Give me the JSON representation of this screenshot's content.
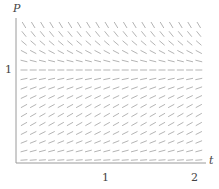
{
  "chart_data": {
    "type": "slope-field",
    "title": "",
    "xlabel": "t",
    "ylabel": "P",
    "x_ticks": [
      "1",
      "2"
    ],
    "y_ticks": [
      "1"
    ],
    "xlim": [
      0,
      2.1
    ],
    "ylim": [
      0,
      1.9
    ],
    "equation_form": "dP/dt = k P (1 - P)",
    "equilibrium": 1,
    "grid": false,
    "legend": null,
    "colors": {
      "axis": "#9a9a9a",
      "segments": "#b4b4b4",
      "text": "#444444"
    }
  },
  "labels": {
    "y_axis": "P",
    "x_axis": "t",
    "y_tick_1": "1",
    "x_tick_1": "1",
    "x_tick_2": "2"
  }
}
